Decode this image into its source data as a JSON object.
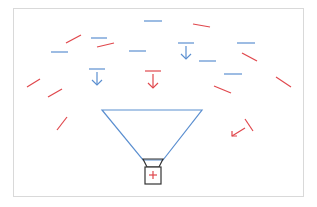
{
  "diagram": {
    "colors": {
      "blue": "#5b8fd0",
      "red": "#e0474c",
      "dark": "#333333",
      "frame": "#d9d9d9"
    },
    "frame": {
      "x": 13,
      "y": 8,
      "w": 290,
      "h": 188
    },
    "blue_dashes": [
      {
        "x1": 144,
        "y1": 21,
        "x2": 162,
        "y2": 21
      },
      {
        "x1": 91,
        "y1": 38,
        "x2": 107,
        "y2": 38
      },
      {
        "x1": 51,
        "y1": 52,
        "x2": 68,
        "y2": 52
      },
      {
        "x1": 129,
        "y1": 51,
        "x2": 146,
        "y2": 51
      },
      {
        "x1": 237,
        "y1": 43,
        "x2": 255,
        "y2": 43
      },
      {
        "x1": 199,
        "y1": 61,
        "x2": 216,
        "y2": 61
      },
      {
        "x1": 224,
        "y1": 74,
        "x2": 242,
        "y2": 74
      }
    ],
    "red_dashes": [
      {
        "x1": 66,
        "y1": 43,
        "x2": 81,
        "y2": 35
      },
      {
        "x1": 97,
        "y1": 47,
        "x2": 114,
        "y2": 43
      },
      {
        "x1": 193,
        "y1": 24,
        "x2": 210,
        "y2": 27
      },
      {
        "x1": 242,
        "y1": 53,
        "x2": 257,
        "y2": 61
      },
      {
        "x1": 214,
        "y1": 86,
        "x2": 231,
        "y2": 93
      },
      {
        "x1": 276,
        "y1": 77,
        "x2": 291,
        "y2": 87
      },
      {
        "x1": 27,
        "y1": 87,
        "x2": 40,
        "y2": 79
      },
      {
        "x1": 48,
        "y1": 97,
        "x2": 62,
        "y2": 89
      },
      {
        "x1": 57,
        "y1": 130,
        "x2": 67,
        "y2": 117
      },
      {
        "x1": 245,
        "y1": 119,
        "x2": 253,
        "y2": 131
      }
    ],
    "arrows": [
      {
        "name": "blue-down-arrow-left",
        "color": "blue",
        "x": 97,
        "bar_y": 69,
        "tip_y": 85,
        "bar_w": 16
      },
      {
        "name": "blue-down-arrow-right",
        "color": "blue",
        "x": 186,
        "bar_y": 43,
        "tip_y": 59,
        "bar_w": 16
      },
      {
        "name": "red-down-arrow",
        "color": "red",
        "x": 153,
        "bar_y": 71,
        "tip_y": 88,
        "bar_w": 16
      }
    ],
    "diag_arrow": {
      "x1": 245,
      "y1": 128,
      "x2": 232,
      "y2": 136
    },
    "funnel": {
      "top_left": [
        102,
        110
      ],
      "top_right": [
        202,
        110
      ],
      "bottom_left": [
        143,
        160
      ],
      "bottom_right": [
        163,
        160
      ]
    },
    "cannon": {
      "neck": {
        "top_left": [
          143,
          159
        ],
        "top_right": [
          163,
          159
        ],
        "bottom_left": [
          147,
          167
        ],
        "bottom_right": [
          159,
          167
        ]
      },
      "box": {
        "x": 145,
        "y": 167,
        "w": 16,
        "h": 17
      },
      "plus": {
        "cx": 153,
        "cy": 175,
        "size": 4
      }
    }
  }
}
